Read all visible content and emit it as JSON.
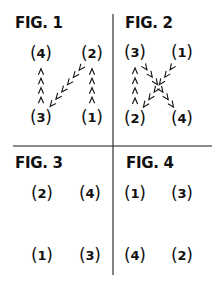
{
  "colors": {
    "ink": "#111111",
    "divider": "#555555",
    "background": "#ffffff"
  },
  "figures": [
    {
      "label": "FIG. 1",
      "nodes": [
        {
          "id": "4",
          "x": 41,
          "y": 54
        },
        {
          "id": "2",
          "x": 92,
          "y": 54
        },
        {
          "id": "3",
          "x": 41,
          "y": 118
        },
        {
          "id": "1",
          "x": 92,
          "y": 118
        }
      ],
      "arrows": [
        {
          "from": "1",
          "to": "2"
        },
        {
          "from": "2",
          "to": "3"
        },
        {
          "from": "3",
          "to": "4"
        }
      ]
    },
    {
      "label": "FIG. 2",
      "nodes": [
        {
          "id": "3",
          "x": 135,
          "y": 53
        },
        {
          "id": "1",
          "x": 182,
          "y": 53
        },
        {
          "id": "2",
          "x": 135,
          "y": 119
        },
        {
          "id": "4",
          "x": 182,
          "y": 119
        }
      ],
      "arrows": [
        {
          "from": "1",
          "to": "2"
        },
        {
          "from": "2",
          "to": "3"
        },
        {
          "from": "3",
          "to": "4"
        }
      ]
    },
    {
      "label": "FIG. 3",
      "nodes": [
        {
          "id": "2",
          "x": 42,
          "y": 194
        },
        {
          "id": "4",
          "x": 90,
          "y": 194
        },
        {
          "id": "1",
          "x": 42,
          "y": 256
        },
        {
          "id": "3",
          "x": 90,
          "y": 256
        }
      ],
      "arrows": []
    },
    {
      "label": "FIG. 4",
      "nodes": [
        {
          "id": "1",
          "x": 135,
          "y": 194
        },
        {
          "id": "3",
          "x": 182,
          "y": 194
        },
        {
          "id": "4",
          "x": 135,
          "y": 256
        },
        {
          "id": "2",
          "x": 182,
          "y": 256
        }
      ],
      "arrows": []
    }
  ]
}
